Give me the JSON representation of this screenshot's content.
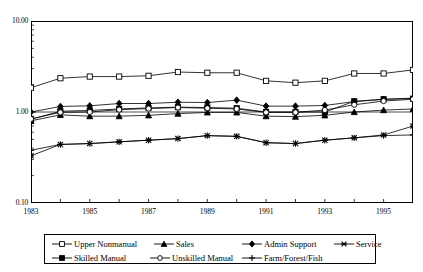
{
  "chart_data": {
    "type": "line",
    "title": "",
    "subtitle": "",
    "xlabel": "",
    "ylabel": "",
    "yscale": "log",
    "ylim": [
      0.1,
      10.0
    ],
    "xlim": [
      1983,
      1996
    ],
    "grid": false,
    "legend_position": "bottom",
    "y_tick_labels": [
      "10.00",
      "1.00",
      "0.10"
    ],
    "y_tick_values": [
      10.0,
      1.0,
      0.1
    ],
    "x_tick_labels": [
      "1983",
      "1985",
      "1987",
      "1989",
      "1991",
      "1993",
      "1995"
    ],
    "x_tick_values": [
      1983,
      1985,
      1987,
      1989,
      1991,
      1993,
      1995
    ],
    "x": [
      1983,
      1984,
      1985,
      1986,
      1987,
      1988,
      1989,
      1990,
      1991,
      1992,
      1993,
      1994,
      1995,
      1996
    ],
    "series": [
      {
        "name": "Upper Nonmanual",
        "marker": "open-square",
        "values": [
          1.85,
          2.35,
          2.45,
          2.45,
          2.5,
          2.75,
          2.7,
          2.7,
          2.2,
          2.1,
          2.2,
          2.65,
          2.65,
          2.9
        ]
      },
      {
        "name": "Sales",
        "marker": "filled-triangle",
        "values": [
          0.8,
          0.93,
          0.9,
          0.9,
          0.92,
          0.96,
          0.99,
          0.99,
          0.9,
          0.89,
          0.92,
          1.0,
          1.05,
          1.08
        ]
      },
      {
        "name": "Admin Support",
        "marker": "filled-diamond",
        "values": [
          1.0,
          1.15,
          1.17,
          1.24,
          1.24,
          1.28,
          1.27,
          1.35,
          1.16,
          1.16,
          1.18,
          1.3,
          1.38,
          1.42
        ]
      },
      {
        "name": "Service",
        "marker": "asterisk",
        "values": [
          0.33,
          0.44,
          0.45,
          0.47,
          0.49,
          0.51,
          0.55,
          0.54,
          0.46,
          0.45,
          0.49,
          0.52,
          0.56,
          0.7
        ]
      },
      {
        "name": "Skilled Manual",
        "marker": "filled-square",
        "values": [
          0.83,
          1.02,
          1.04,
          1.08,
          1.11,
          1.13,
          1.12,
          1.1,
          1.0,
          1.0,
          1.0,
          1.31,
          1.38,
          1.4
        ]
      },
      {
        "name": "Unskilled Manual",
        "marker": "open-circle",
        "values": [
          0.84,
          0.99,
          1.0,
          1.06,
          1.09,
          1.12,
          1.1,
          1.08,
          0.99,
          0.99,
          1.05,
          1.2,
          1.32,
          1.38
        ]
      },
      {
        "name": "Farm/Forest/Fish",
        "marker": "plus",
        "values": [
          0.38,
          0.44,
          0.45,
          0.47,
          0.49,
          0.51,
          0.55,
          0.54,
          0.46,
          0.45,
          0.49,
          0.52,
          0.55,
          0.56
        ]
      }
    ]
  },
  "legend": {
    "row1": [
      {
        "label": "Upper Nonmanual",
        "marker": "open-square"
      },
      {
        "label": "Sales",
        "marker": "filled-triangle"
      },
      {
        "label": "Admin Support",
        "marker": "filled-diamond"
      },
      {
        "label": "Service",
        "marker": "asterisk"
      }
    ],
    "row2": [
      {
        "label": "Skilled Manual",
        "marker": "filled-square"
      },
      {
        "label": "Unskilled Manual",
        "marker": "open-circle"
      },
      {
        "label": "Farm/Forest/Fish",
        "marker": "plus"
      }
    ]
  },
  "axis": {
    "y_labels": [
      "10.00",
      "1.00",
      "0.10"
    ],
    "x_labels": [
      "1983",
      "1985",
      "1987",
      "1989",
      "1991",
      "1993",
      "1995"
    ]
  },
  "colors": {
    "line": "#000000",
    "frame": "#000000",
    "background": "#ffffff"
  }
}
